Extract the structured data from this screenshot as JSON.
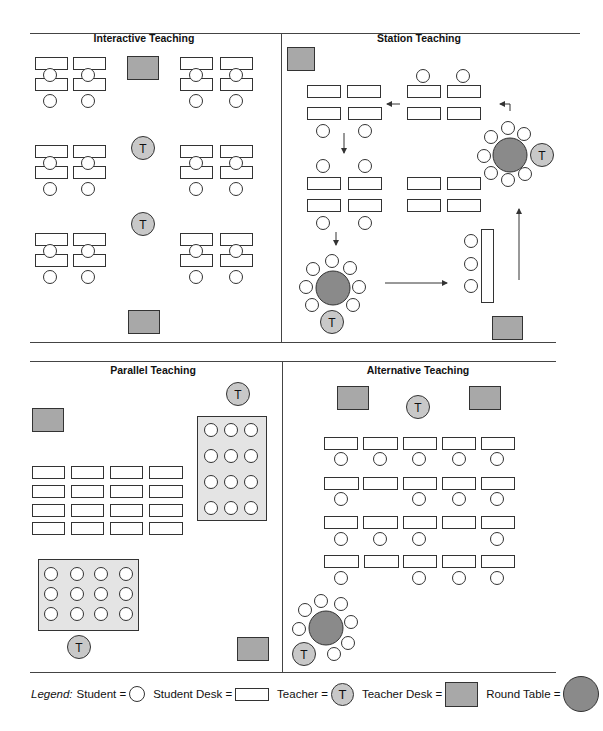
{
  "colors": {
    "line": "#333333",
    "student_fill": "#ffffff",
    "desk_fill": "#ffffff",
    "teacher_fill": "#c8c8c8",
    "teacher_desk_fill": "#a8a8a8",
    "round_table_fill": "#8a8a8a",
    "group_area_fill": "#e4e4e4"
  },
  "panels": [
    {
      "id": "interactive",
      "title": "Interactive Teaching",
      "title_pos": [
        144,
        42
      ],
      "desks": [
        [
          35,
          57,
          32,
          12
        ],
        [
          73,
          57,
          32,
          12
        ],
        [
          180,
          57,
          32,
          12
        ],
        [
          220,
          57,
          32,
          12
        ],
        [
          35,
          78,
          32,
          12
        ],
        [
          73,
          78,
          32,
          12
        ],
        [
          180,
          78,
          32,
          12
        ],
        [
          220,
          78,
          32,
          12
        ],
        [
          35,
          145,
          32,
          12
        ],
        [
          73,
          145,
          32,
          12
        ],
        [
          180,
          145,
          32,
          12
        ],
        [
          220,
          145,
          32,
          12
        ],
        [
          35,
          166,
          32,
          12
        ],
        [
          73,
          166,
          32,
          12
        ],
        [
          180,
          166,
          32,
          12
        ],
        [
          220,
          166,
          32,
          12
        ],
        [
          35,
          233,
          32,
          12
        ],
        [
          73,
          233,
          32,
          12
        ],
        [
          180,
          233,
          32,
          12
        ],
        [
          220,
          233,
          32,
          12
        ],
        [
          35,
          254,
          32,
          12
        ],
        [
          73,
          254,
          32,
          12
        ],
        [
          180,
          254,
          32,
          12
        ],
        [
          220,
          254,
          32,
          12
        ]
      ],
      "students": [
        [
          50,
          75
        ],
        [
          88,
          75
        ],
        [
          196,
          75
        ],
        [
          236,
          75
        ],
        [
          50,
          101
        ],
        [
          88,
          101
        ],
        [
          196,
          101
        ],
        [
          236,
          101
        ],
        [
          50,
          163
        ],
        [
          88,
          163
        ],
        [
          196,
          163
        ],
        [
          236,
          163
        ],
        [
          50,
          189
        ],
        [
          88,
          189
        ],
        [
          196,
          189
        ],
        [
          236,
          189
        ],
        [
          50,
          251
        ],
        [
          88,
          251
        ],
        [
          196,
          251
        ],
        [
          236,
          251
        ],
        [
          50,
          277
        ],
        [
          88,
          277
        ],
        [
          196,
          277
        ],
        [
          236,
          277
        ]
      ],
      "teachers": [
        [
          143,
          148
        ],
        [
          143,
          224
        ]
      ],
      "teacher_desks": [
        [
          127,
          56,
          31,
          23
        ],
        [
          128,
          310,
          31,
          23
        ]
      ],
      "round_tables": [],
      "group_areas": [],
      "arrows": []
    },
    {
      "id": "station",
      "title": "Station Teaching",
      "title_pos": [
        419,
        42
      ],
      "desks": [
        [
          307,
          85,
          33,
          12
        ],
        [
          347,
          85,
          33,
          12
        ],
        [
          407,
          85,
          33,
          12
        ],
        [
          447,
          85,
          33,
          12
        ],
        [
          307,
          107,
          33,
          12
        ],
        [
          348,
          107,
          33,
          12
        ],
        [
          407,
          107,
          33,
          12
        ],
        [
          447,
          107,
          33,
          12
        ],
        [
          307,
          177,
          33,
          12
        ],
        [
          348,
          177,
          33,
          12
        ],
        [
          407,
          177,
          33,
          12
        ],
        [
          447,
          177,
          33,
          12
        ],
        [
          307,
          199,
          33,
          12
        ],
        [
          348,
          199,
          33,
          12
        ],
        [
          407,
          199,
          33,
          12
        ],
        [
          447,
          199,
          33,
          12
        ],
        [
          481,
          229,
          12,
          73
        ]
      ],
      "students": [
        [
          423,
          76
        ],
        [
          463,
          76
        ],
        [
          323,
          131
        ],
        [
          365,
          131
        ],
        [
          323,
          166
        ],
        [
          365,
          166
        ],
        [
          323,
          223
        ],
        [
          365,
          223
        ],
        [
          471,
          241
        ],
        [
          471,
          264
        ],
        [
          471,
          286
        ]
      ],
      "teachers": [
        [
          542,
          155
        ],
        [
          332,
          322
        ]
      ],
      "teacher_desks": [
        [
          287,
          47,
          27,
          23
        ],
        [
          492,
          316,
          30,
          23
        ]
      ],
      "round_tables": [
        {
          "cx": 510,
          "cy": 155,
          "r": 17,
          "seats": [
            [
              508,
              128
            ],
            [
              524,
              134
            ],
            [
              491,
              137
            ],
            [
              484,
              156
            ],
            [
              491,
              173
            ],
            [
              508,
              180
            ],
            [
              525,
              174
            ]
          ]
        },
        {
          "cx": 333,
          "cy": 288,
          "r": 17,
          "seats": [
            [
              332,
              261
            ],
            [
              313,
              269
            ],
            [
              350,
              268
            ],
            [
              306,
              287
            ],
            [
              359,
              287
            ],
            [
              312,
              305
            ],
            [
              353,
              305
            ]
          ]
        }
      ],
      "group_areas": [],
      "arrows": [
        {
          "points": [
            [
              400,
              104
            ],
            [
              387,
              104
            ]
          ]
        },
        {
          "points": [
            [
              510,
              111
            ],
            [
              510,
              104
            ],
            [
              500,
              104
            ]
          ]
        },
        {
          "points": [
            [
              344,
              133
            ],
            [
              344,
              153
            ]
          ]
        },
        {
          "points": [
            [
              336,
              232
            ],
            [
              336,
              245
            ]
          ]
        },
        {
          "points": [
            [
              385,
              283
            ],
            [
              447,
              283
            ]
          ]
        },
        {
          "points": [
            [
              519,
              280
            ],
            [
              519,
              209
            ]
          ]
        }
      ]
    },
    {
      "id": "parallel",
      "title": "Parallel Teaching",
      "title_pos": [
        153,
        374
      ],
      "desks": [
        [
          32,
          466,
          32,
          12
        ],
        [
          71,
          466,
          32,
          12
        ],
        [
          110,
          466,
          32,
          12
        ],
        [
          149,
          466,
          33,
          12
        ],
        [
          32,
          485,
          32,
          12
        ],
        [
          71,
          485,
          32,
          12
        ],
        [
          110,
          485,
          32,
          12
        ],
        [
          149,
          485,
          33,
          12
        ],
        [
          32,
          504,
          32,
          12
        ],
        [
          71,
          504,
          32,
          12
        ],
        [
          110,
          504,
          32,
          12
        ],
        [
          149,
          504,
          33,
          12
        ],
        [
          32,
          522,
          32,
          12
        ],
        [
          71,
          522,
          32,
          12
        ],
        [
          110,
          522,
          32,
          12
        ],
        [
          149,
          522,
          33,
          12
        ]
      ],
      "students": [
        [
          211,
          430
        ],
        [
          231,
          430
        ],
        [
          251,
          430
        ],
        [
          211,
          456
        ],
        [
          231,
          456
        ],
        [
          251,
          456
        ],
        [
          211,
          482
        ],
        [
          231,
          482
        ],
        [
          251,
          482
        ],
        [
          211,
          508
        ],
        [
          231,
          508
        ],
        [
          251,
          508
        ],
        [
          51,
          574
        ],
        [
          77,
          574
        ],
        [
          101,
          574
        ],
        [
          126,
          574
        ],
        [
          51,
          594
        ],
        [
          77,
          594
        ],
        [
          101,
          594
        ],
        [
          126,
          594
        ],
        [
          51,
          614
        ],
        [
          77,
          614
        ],
        [
          101,
          614
        ],
        [
          126,
          614
        ]
      ],
      "teachers": [
        [
          238,
          394
        ],
        [
          79,
          647
        ]
      ],
      "teacher_desks": [
        [
          32,
          408,
          31,
          23
        ],
        [
          237,
          637,
          31,
          23
        ]
      ],
      "round_tables": [],
      "group_areas": [
        [
          197,
          416,
          69,
          104
        ],
        [
          38,
          559,
          100,
          71
        ]
      ],
      "arrows": []
    },
    {
      "id": "alternative",
      "title": "Alternative Teaching",
      "title_pos": [
        418,
        374
      ],
      "desks": [
        [
          324,
          437,
          33,
          12
        ],
        [
          363,
          437,
          34,
          12
        ],
        [
          403,
          437,
          33,
          12
        ],
        [
          442,
          437,
          33,
          12
        ],
        [
          481,
          437,
          33,
          12
        ],
        [
          324,
          477,
          34,
          12
        ],
        [
          363,
          477,
          34,
          12
        ],
        [
          403,
          477,
          33,
          12
        ],
        [
          442,
          477,
          33,
          12
        ],
        [
          481,
          477,
          33,
          12
        ],
        [
          324,
          516,
          33,
          12
        ],
        [
          363,
          516,
          34,
          12
        ],
        [
          403,
          516,
          33,
          12
        ],
        [
          442,
          516,
          33,
          12
        ],
        [
          481,
          516,
          33,
          12
        ],
        [
          324,
          555,
          34,
          12
        ],
        [
          364,
          555,
          34,
          12
        ],
        [
          403,
          555,
          33,
          12
        ],
        [
          442,
          555,
          33,
          12
        ],
        [
          481,
          555,
          33,
          12
        ]
      ],
      "students": [
        [
          341,
          459
        ],
        [
          380,
          459
        ],
        [
          419,
          459
        ],
        [
          459,
          459
        ],
        [
          497,
          459
        ],
        [
          341,
          499
        ],
        [
          419,
          499
        ],
        [
          459,
          499
        ],
        [
          497,
          499
        ],
        [
          341,
          539
        ],
        [
          380,
          539
        ],
        [
          419,
          539
        ],
        [
          497,
          539
        ],
        [
          341,
          578
        ],
        [
          419,
          578
        ],
        [
          459,
          578
        ],
        [
          497,
          578
        ]
      ],
      "teachers": [
        [
          418,
          407
        ],
        [
          304,
          654
        ]
      ],
      "teacher_desks": [
        [
          337,
          386,
          31,
          23
        ],
        [
          469,
          386,
          31,
          23
        ]
      ],
      "round_tables": [
        {
          "cx": 326,
          "cy": 628,
          "r": 17,
          "seats": [
            [
              321,
              601
            ],
            [
              305,
              610
            ],
            [
              341,
              604
            ],
            [
              299,
              629
            ],
            [
              351,
              622
            ],
            [
              348,
              643
            ],
            [
              334,
              654
            ]
          ]
        }
      ],
      "group_areas": [],
      "arrows": []
    }
  ],
  "legend": {
    "prefix": "Legend:",
    "items": [
      {
        "label": "Student =",
        "symbol": "student"
      },
      {
        "label": "Student Desk =",
        "symbol": "desk"
      },
      {
        "label": "Teacher =",
        "symbol": "teacher",
        "glyph": "T"
      },
      {
        "label": "Teacher Desk =",
        "symbol": "teacher-desk"
      },
      {
        "label": "Round Table =",
        "symbol": "round-table"
      }
    ]
  },
  "teacher_glyph": "T"
}
